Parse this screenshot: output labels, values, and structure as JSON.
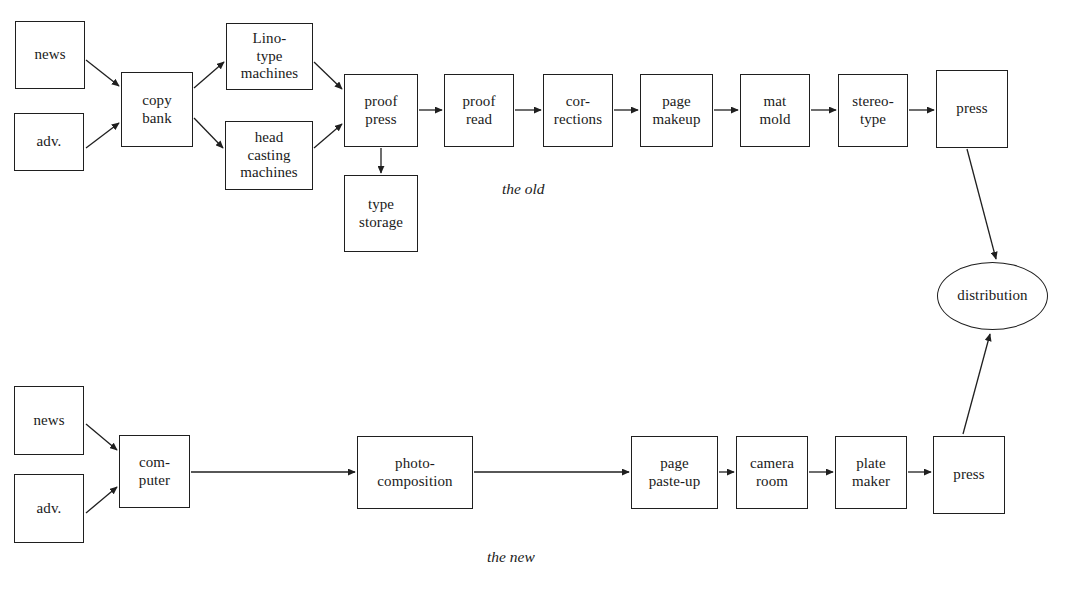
{
  "diagram": {
    "background_color": "#ffffff",
    "line_color": "#1f1f1f",
    "text_color": "#1a1a1a",
    "width": 1090,
    "height": 596,
    "captions": [
      {
        "id": "caption-the-old",
        "text": "the old",
        "x": 502,
        "y": 180
      },
      {
        "id": "caption-the-new",
        "text": "the new",
        "x": 487,
        "y": 548
      }
    ],
    "nodes": [
      {
        "id": "old-news",
        "label": "news",
        "shape": "rect",
        "x": 15,
        "y": 21,
        "w": 70,
        "h": 68
      },
      {
        "id": "old-adv",
        "label": "adv.",
        "shape": "rect",
        "x": 14,
        "y": 113,
        "w": 70,
        "h": 58
      },
      {
        "id": "old-copy-bank",
        "label": "copy\nbank",
        "shape": "rect",
        "x": 121,
        "y": 72,
        "w": 72,
        "h": 75
      },
      {
        "id": "old-linotype",
        "label": "Lino-\ntype\nmachines",
        "shape": "rect",
        "x": 226,
        "y": 23,
        "w": 87,
        "h": 67
      },
      {
        "id": "old-head-cast",
        "label": "head\ncasting\nmachines",
        "shape": "rect",
        "x": 225,
        "y": 121,
        "w": 88,
        "h": 69
      },
      {
        "id": "old-proof-press",
        "label": "proof\npress",
        "shape": "rect",
        "x": 344,
        "y": 74,
        "w": 74,
        "h": 73
      },
      {
        "id": "old-type-storage",
        "label": "type\nstorage",
        "shape": "rect",
        "x": 344,
        "y": 175,
        "w": 74,
        "h": 77
      },
      {
        "id": "old-proof-read",
        "label": "proof\nread",
        "shape": "rect",
        "x": 444,
        "y": 74,
        "w": 70,
        "h": 73
      },
      {
        "id": "old-corrections",
        "label": "cor-\nrections",
        "shape": "rect",
        "x": 543,
        "y": 74,
        "w": 70,
        "h": 73
      },
      {
        "id": "old-page-makeup",
        "label": "page\nmakeup",
        "shape": "rect",
        "x": 640,
        "y": 74,
        "w": 73,
        "h": 73
      },
      {
        "id": "old-mat-mold",
        "label": "mat\nmold",
        "shape": "rect",
        "x": 740,
        "y": 74,
        "w": 70,
        "h": 73
      },
      {
        "id": "old-stereotype",
        "label": "stereo-\ntype",
        "shape": "rect",
        "x": 838,
        "y": 74,
        "w": 70,
        "h": 73
      },
      {
        "id": "old-press",
        "label": "press",
        "shape": "rect",
        "x": 936,
        "y": 70,
        "w": 72,
        "h": 78
      },
      {
        "id": "distribution",
        "label": "distribution",
        "shape": "ellipse",
        "x": 937,
        "y": 262,
        "w": 111,
        "h": 68
      },
      {
        "id": "new-news",
        "label": "news",
        "shape": "rect",
        "x": 14,
        "y": 386,
        "w": 70,
        "h": 69
      },
      {
        "id": "new-adv",
        "label": "adv.",
        "shape": "rect",
        "x": 14,
        "y": 474,
        "w": 70,
        "h": 69
      },
      {
        "id": "new-computer",
        "label": "com-\nputer",
        "shape": "rect",
        "x": 119,
        "y": 435,
        "w": 71,
        "h": 73
      },
      {
        "id": "new-photocomp",
        "label": "photo-\ncomposition",
        "shape": "rect",
        "x": 357,
        "y": 436,
        "w": 116,
        "h": 73
      },
      {
        "id": "new-page-pasteup",
        "label": "page\npaste-up",
        "shape": "rect",
        "x": 631,
        "y": 436,
        "w": 87,
        "h": 73
      },
      {
        "id": "new-camera-room",
        "label": "camera\nroom",
        "shape": "rect",
        "x": 736,
        "y": 436,
        "w": 72,
        "h": 73
      },
      {
        "id": "new-plate-maker",
        "label": "plate\nmaker",
        "shape": "rect",
        "x": 835,
        "y": 436,
        "w": 72,
        "h": 73
      },
      {
        "id": "new-press",
        "label": "press",
        "shape": "rect",
        "x": 933,
        "y": 436,
        "w": 72,
        "h": 78
      }
    ],
    "edges": [
      {
        "id": "edge-old-news-to-copy-bank",
        "from": "old-news",
        "to": "old-copy-bank",
        "x1": 86,
        "y1": 60,
        "x2": 119,
        "y2": 86,
        "arrow": true
      },
      {
        "id": "edge-old-adv-to-copy-bank",
        "from": "old-adv",
        "to": "old-copy-bank",
        "x1": 86,
        "y1": 148,
        "x2": 119,
        "y2": 123,
        "arrow": true
      },
      {
        "id": "edge-copy-bank-to-linotype",
        "from": "old-copy-bank",
        "to": "old-linotype",
        "x1": 194,
        "y1": 88,
        "x2": 224,
        "y2": 62,
        "arrow": true
      },
      {
        "id": "edge-copy-bank-to-head-casting",
        "from": "old-copy-bank",
        "to": "old-head-cast",
        "x1": 194,
        "y1": 118,
        "x2": 223,
        "y2": 148,
        "arrow": true
      },
      {
        "id": "edge-linotype-to-proof-press",
        "from": "old-linotype",
        "to": "old-proof-press",
        "x1": 314,
        "y1": 62,
        "x2": 342,
        "y2": 89,
        "arrow": true
      },
      {
        "id": "edge-head-casting-to-proof-press",
        "from": "old-head-cast",
        "to": "old-proof-press",
        "x1": 314,
        "y1": 148,
        "x2": 342,
        "y2": 124,
        "arrow": true
      },
      {
        "id": "edge-proof-press-to-type-storage",
        "from": "old-proof-press",
        "to": "old-type-storage",
        "x1": 381,
        "y1": 148,
        "x2": 381,
        "y2": 173,
        "arrow": true
      },
      {
        "id": "edge-proof-press-to-proof-read",
        "from": "old-proof-press",
        "to": "old-proof-read",
        "x1": 419,
        "y1": 110,
        "x2": 442,
        "y2": 110,
        "arrow": true
      },
      {
        "id": "edge-proof-read-to-corrections",
        "from": "old-proof-read",
        "to": "old-corrections",
        "x1": 515,
        "y1": 110,
        "x2": 541,
        "y2": 110,
        "arrow": true
      },
      {
        "id": "edge-corrections-to-page-makeup",
        "from": "old-corrections",
        "to": "old-page-makeup",
        "x1": 614,
        "y1": 110,
        "x2": 638,
        "y2": 110,
        "arrow": true
      },
      {
        "id": "edge-page-makeup-to-mat-mold",
        "from": "old-page-makeup",
        "to": "old-mat-mold",
        "x1": 714,
        "y1": 110,
        "x2": 738,
        "y2": 110,
        "arrow": true
      },
      {
        "id": "edge-mat-mold-to-stereotype",
        "from": "old-mat-mold",
        "to": "old-stereotype",
        "x1": 811,
        "y1": 110,
        "x2": 836,
        "y2": 110,
        "arrow": true
      },
      {
        "id": "edge-stereotype-to-old-press",
        "from": "old-stereotype",
        "to": "old-press",
        "x1": 909,
        "y1": 110,
        "x2": 934,
        "y2": 110,
        "arrow": true
      },
      {
        "id": "edge-old-press-to-distribution",
        "from": "old-press",
        "to": "distribution",
        "x1": 967,
        "y1": 149,
        "x2": 996,
        "y2": 259,
        "arrow": true
      },
      {
        "id": "edge-new-news-to-computer",
        "from": "new-news",
        "to": "new-computer",
        "x1": 86,
        "y1": 424,
        "x2": 117,
        "y2": 450,
        "arrow": true
      },
      {
        "id": "edge-new-adv-to-computer",
        "from": "new-adv",
        "to": "new-computer",
        "x1": 86,
        "y1": 513,
        "x2": 117,
        "y2": 487,
        "arrow": true
      },
      {
        "id": "edge-computer-to-photocomposition",
        "from": "new-computer",
        "to": "new-photocomp",
        "x1": 191,
        "y1": 472,
        "x2": 355,
        "y2": 472,
        "arrow": true
      },
      {
        "id": "edge-photocomposition-to-page-pasteup",
        "from": "new-photocomp",
        "to": "new-page-pasteup",
        "x1": 474,
        "y1": 472,
        "x2": 629,
        "y2": 472,
        "arrow": true
      },
      {
        "id": "edge-page-pasteup-to-camera-room",
        "from": "new-page-pasteup",
        "to": "new-camera-room",
        "x1": 719,
        "y1": 472,
        "x2": 734,
        "y2": 472,
        "arrow": true
      },
      {
        "id": "edge-camera-room-to-plate-maker",
        "from": "new-camera-room",
        "to": "new-plate-maker",
        "x1": 809,
        "y1": 472,
        "x2": 833,
        "y2": 472,
        "arrow": true
      },
      {
        "id": "edge-plate-maker-to-new-press",
        "from": "new-plate-maker",
        "to": "new-press",
        "x1": 908,
        "y1": 472,
        "x2": 931,
        "y2": 472,
        "arrow": true
      },
      {
        "id": "edge-new-press-to-distribution",
        "from": "new-press",
        "to": "distribution",
        "x1": 963,
        "y1": 434,
        "x2": 990,
        "y2": 334,
        "arrow": true
      }
    ]
  }
}
